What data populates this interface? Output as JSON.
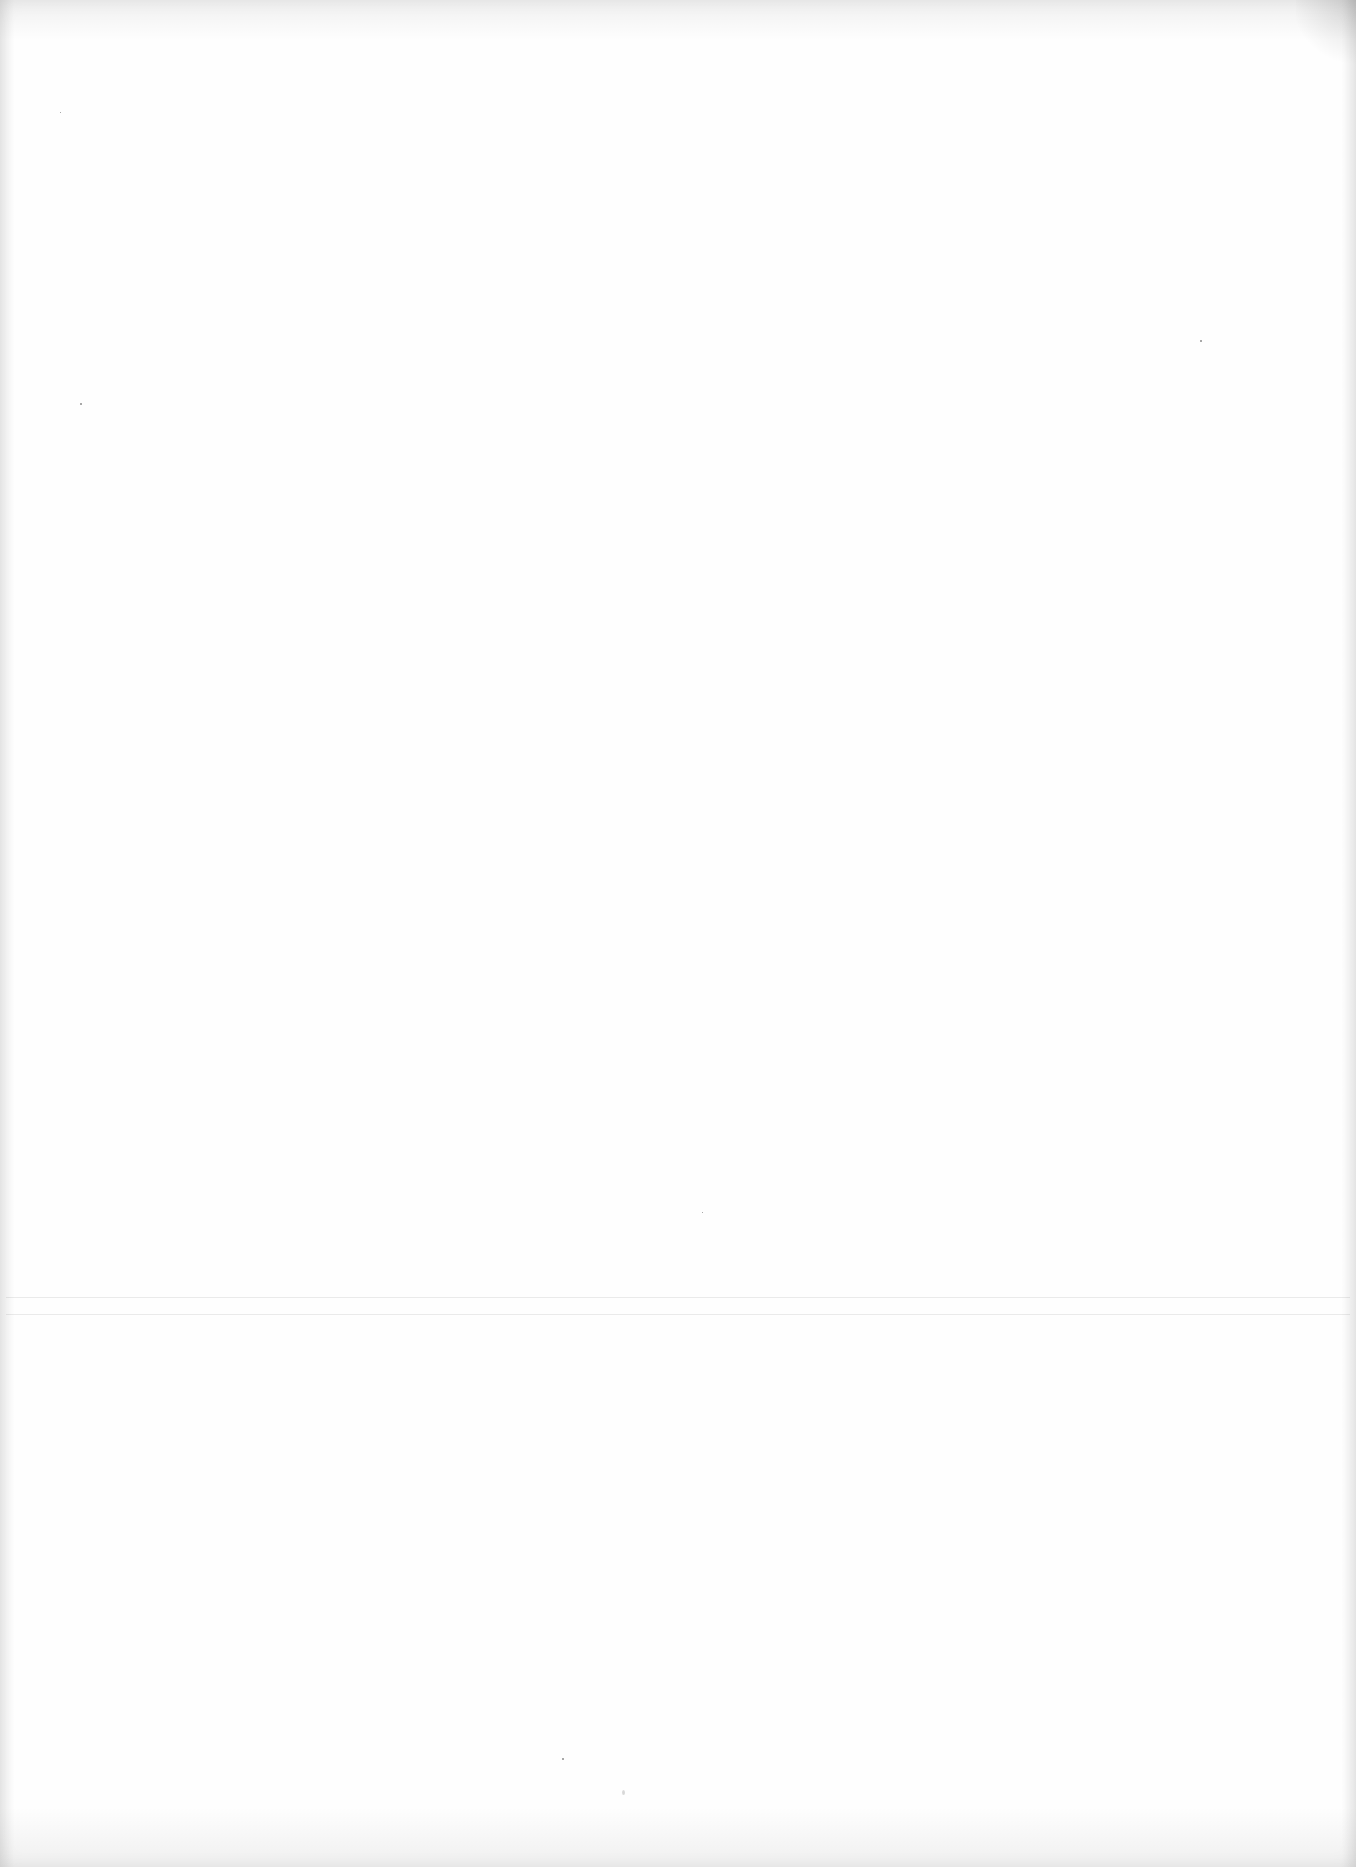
{
  "page": {
    "type": "blank scanned page",
    "text": ""
  }
}
